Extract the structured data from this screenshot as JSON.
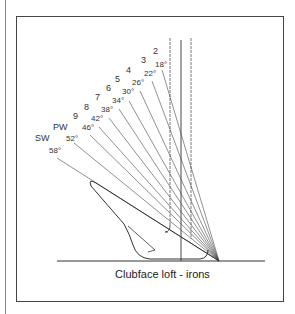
{
  "figure": {
    "caption": "Clubface loft - irons",
    "clubs": [
      {
        "name": "2",
        "loft": "18°"
      },
      {
        "name": "3",
        "loft": "22°"
      },
      {
        "name": "4",
        "loft": "26°"
      },
      {
        "name": "5",
        "loft": "30°"
      },
      {
        "name": "6",
        "loft": "34°"
      },
      {
        "name": "7",
        "loft": "38°"
      },
      {
        "name": "8",
        "loft": "42°"
      },
      {
        "name": "9",
        "loft": "46°"
      },
      {
        "name": "PW",
        "loft": "52°"
      },
      {
        "name": "SW",
        "loft": "58°"
      }
    ]
  }
}
